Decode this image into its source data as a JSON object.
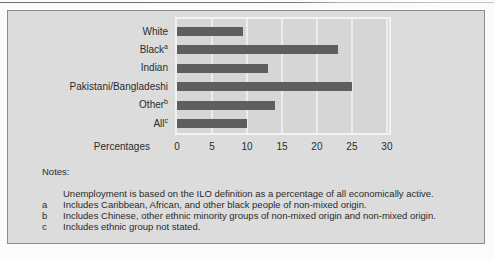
{
  "colors": {
    "panel_bg": "#dcdcdc",
    "panel_border": "#8c8c8c",
    "plot_bg": "#d6d6d6",
    "plot_border": "#f2f2f2",
    "gridline": "#ececec",
    "bar": "#5e5e5e",
    "text": "#2b2b2b"
  },
  "chart_data": {
    "type": "bar",
    "orientation": "horizontal",
    "title": "",
    "xlabel": "Percentages",
    "ylabel": "",
    "grid": true,
    "legend": false,
    "xlim": [
      0,
      30.3
    ],
    "x_ticks": [
      0,
      5,
      10,
      15,
      20,
      25,
      30
    ],
    "categories": [
      {
        "label": "White",
        "sup": ""
      },
      {
        "label": "Black",
        "sup": "a"
      },
      {
        "label": "Indian",
        "sup": ""
      },
      {
        "label": "Pakistani/Bangladeshi",
        "sup": ""
      },
      {
        "label": "Other",
        "sup": "b"
      },
      {
        "label": "All",
        "sup": "c"
      }
    ],
    "values": [
      9.5,
      23,
      13,
      25,
      14,
      10
    ]
  },
  "notes": {
    "heading": "Notes:",
    "items": [
      {
        "marker": "",
        "text": "Unemployment is based on the ILO definition as a percentage of all economically active."
      },
      {
        "marker": "a",
        "text": "Includes Caribbean, African, and other black people of non-mixed origin."
      },
      {
        "marker": "b",
        "text": "Includes Chinese, other ethnic minority groups of non-mixed origin and non-mixed origin."
      },
      {
        "marker": "c",
        "text": "Includes ethnic group not stated."
      }
    ]
  }
}
